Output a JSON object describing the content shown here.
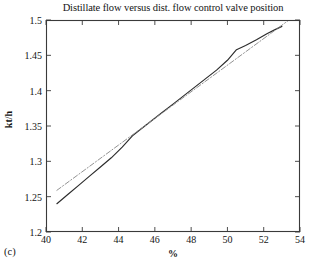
{
  "figure": {
    "panel_caption": "(c)"
  },
  "chart_data": {
    "type": "line",
    "title": "Distillate flow versus dist. flow control valve position",
    "xlabel": "%",
    "ylabel": "kt/h",
    "xlim": [
      40,
      54
    ],
    "ylim": [
      1.2,
      1.5
    ],
    "xticks": [
      40,
      42,
      44,
      46,
      48,
      50,
      52,
      54
    ],
    "yticks": [
      1.2,
      1.25,
      1.3,
      1.35,
      1.4,
      1.45,
      1.5
    ],
    "grid": false,
    "legend": "none",
    "tick_direction": "in",
    "box": true,
    "series": [
      {
        "name": "measured",
        "style": "solid",
        "color": "#2b2b2b",
        "x": [
          40.6,
          41.2,
          41.8,
          42.4,
          43.0,
          43.6,
          44.2,
          44.8,
          45.2,
          45.8,
          46.4,
          47.0,
          47.6,
          48.2,
          48.8,
          49.4,
          50.0,
          50.5,
          51.0,
          51.6,
          52.2,
          52.6,
          53.0
        ],
        "y": [
          1.24,
          1.253,
          1.266,
          1.279,
          1.292,
          1.305,
          1.32,
          1.337,
          1.345,
          1.357,
          1.369,
          1.381,
          1.393,
          1.405,
          1.417,
          1.429,
          1.443,
          1.458,
          1.464,
          1.472,
          1.481,
          1.486,
          1.491
        ]
      },
      {
        "name": "linear fit",
        "style": "dash-dot",
        "color": "#8c8c8c",
        "x": [
          40.6,
          53.5
        ],
        "y": [
          1.259,
          1.502
        ]
      }
    ]
  }
}
